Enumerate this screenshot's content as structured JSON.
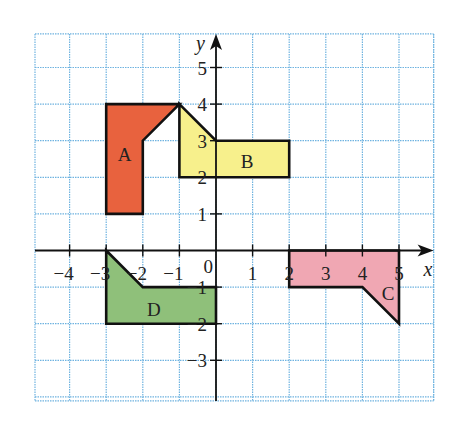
{
  "diagram": {
    "type": "coordinate-grid",
    "axes": {
      "x_label": "x",
      "y_label": "y",
      "x_range": [
        -5,
        6
      ],
      "y_range": [
        -4,
        6
      ],
      "x_ticks": [
        "−4",
        "−3",
        "−2",
        "−1",
        "1",
        "2",
        "3",
        "4",
        "5"
      ],
      "y_ticks": [
        "5",
        "4",
        "3",
        "2",
        "1",
        "−1",
        "−2",
        "−3"
      ],
      "origin_label": "0"
    },
    "grid": {
      "on": true,
      "color": "#6fb3e0",
      "style": "dotted"
    },
    "shapes": [
      {
        "label": "A",
        "fill": "#e8623e",
        "vertices": [
          [
            -3,
            4
          ],
          [
            -1,
            4
          ],
          [
            -2,
            3
          ],
          [
            -2,
            1
          ],
          [
            -3,
            1
          ]
        ]
      },
      {
        "label": "B",
        "fill": "#f7f08c",
        "vertices": [
          [
            -1,
            4
          ],
          [
            0,
            3
          ],
          [
            2,
            3
          ],
          [
            2,
            2
          ],
          [
            -1,
            2
          ]
        ]
      },
      {
        "label": "C",
        "fill": "#f0a7b3",
        "vertices": [
          [
            2,
            0
          ],
          [
            5,
            0
          ],
          [
            5,
            -2
          ],
          [
            4,
            -1
          ],
          [
            2,
            -1
          ]
        ]
      },
      {
        "label": "D",
        "fill": "#8fc07a",
        "vertices": [
          [
            -3,
            0
          ],
          [
            -2,
            -1
          ],
          [
            0,
            -1
          ],
          [
            0,
            -2
          ],
          [
            -3,
            -2
          ]
        ]
      }
    ]
  }
}
